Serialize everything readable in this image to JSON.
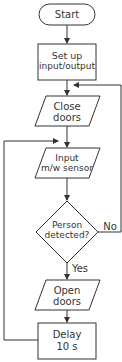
{
  "diagram": {
    "type": "flowchart",
    "nodes": [
      {
        "id": "start",
        "shape": "terminator",
        "line1": "Start",
        "line2": ""
      },
      {
        "id": "setup",
        "shape": "process",
        "line1": "Set up",
        "line2": "input/output"
      },
      {
        "id": "close",
        "shape": "io",
        "line1": "Close",
        "line2": "doors"
      },
      {
        "id": "input",
        "shape": "io",
        "line1": "Input",
        "line2": "m/w sensor"
      },
      {
        "id": "decision",
        "shape": "decision",
        "line1": "Person",
        "line2": "detected?"
      },
      {
        "id": "open",
        "shape": "io",
        "line1": "Open",
        "line2": "doors"
      },
      {
        "id": "delay",
        "shape": "process",
        "line1": "Delay",
        "line2": "10 s"
      }
    ],
    "edge_labels": {
      "no": "No",
      "yes": "Yes"
    },
    "colors": {
      "stroke": "#333333",
      "text": "#333333",
      "background": "#ffffff"
    }
  }
}
